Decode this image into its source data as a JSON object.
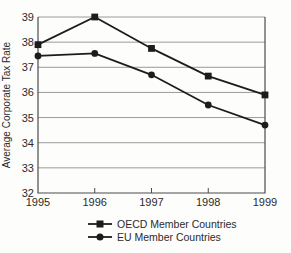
{
  "chart_data": {
    "type": "line",
    "title": "",
    "ylabel": "Average Corporate Tax Rate",
    "xlabel": "",
    "x": [
      1995,
      1996,
      1997,
      1998,
      1999
    ],
    "ylim": [
      32,
      39
    ],
    "ytick_step": 1,
    "yticks": [
      32,
      33,
      34,
      35,
      36,
      37,
      38,
      39
    ],
    "grid": "horizontal",
    "legend_position": "bottom",
    "series": [
      {
        "name": "OECD Member Countries",
        "marker": "square",
        "values": [
          37.9,
          39.0,
          37.75,
          36.65,
          35.9
        ]
      },
      {
        "name": "EU Member Countries",
        "marker": "circle",
        "values": [
          37.45,
          37.55,
          36.7,
          35.5,
          34.7
        ]
      }
    ],
    "colors": {
      "line": "#1c1c1c",
      "grid": "#9a9a9a",
      "axis": "#4c4c4c",
      "text": "#2b2b2b",
      "background": "#fdfdfc"
    }
  }
}
